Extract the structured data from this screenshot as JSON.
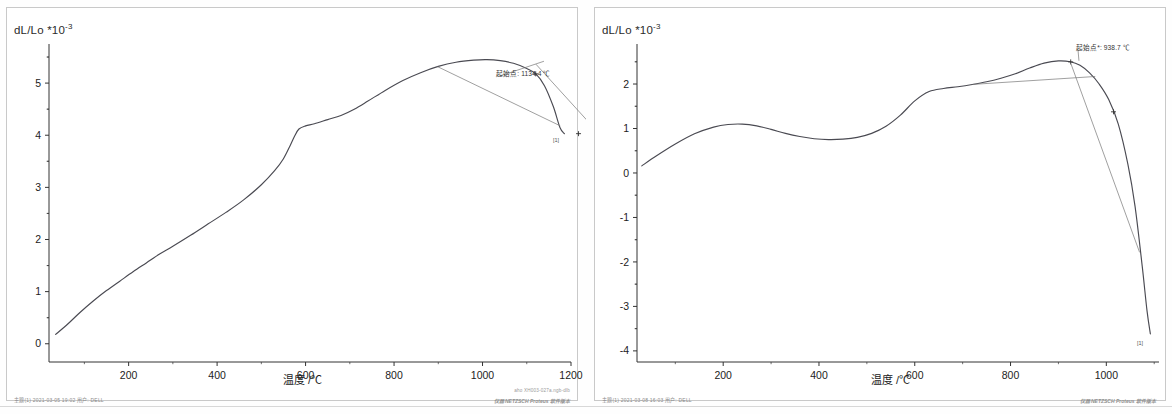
{
  "document": {
    "title": "Thermal dilatometry curves",
    "panel_count": 2
  },
  "charts": [
    {
      "id": "left",
      "ylabel": "dL/Lo *10",
      "ylabel_exp": "-3",
      "xlabel": "温度 /℃",
      "annotation": "起始点: 1134.4 ℃",
      "end_label": "[1]",
      "footer_left": "主题(1)  2021-03-05 19:02    用户: DELL",
      "footer_right": "aho XH003-027a.ngb-dlb",
      "footer_brand": "仪器 NETZSCH Proteus 软件版本",
      "xticks": [
        "200",
        "400",
        "600",
        "800",
        "1000",
        "1200"
      ],
      "yticks": [
        "0",
        "1",
        "2",
        "3",
        "4",
        "5"
      ]
    },
    {
      "id": "right",
      "ylabel": "dL/Lo *10",
      "ylabel_exp": "-3",
      "xlabel": "温度 /℃",
      "annotation": "起始点*: 938.7 ℃",
      "end_label": "[1]",
      "footer_left": "主题(1)  2021-03-08 16:03    用户: DELL",
      "footer_right": "",
      "footer_brand": "仪器 NETZSCH Proteus 软件版本",
      "xticks": [
        "200",
        "400",
        "600",
        "800",
        "1000"
      ],
      "yticks": [
        "-4",
        "-3",
        "-2",
        "-1",
        "0",
        "1",
        "2"
      ]
    }
  ],
  "chart_data": [
    {
      "type": "line",
      "id": "left",
      "title": "",
      "xlabel": "温度 /℃",
      "ylabel": "dL/Lo *10^-3",
      "xlim": [
        20,
        1200
      ],
      "ylim": [
        -0.35,
        5.75
      ],
      "xticks": [
        200,
        400,
        600,
        800,
        1000,
        1200
      ],
      "yticks": [
        0,
        1,
        2,
        3,
        4,
        5
      ],
      "grid": false,
      "legend": false,
      "annotations": [
        {
          "text": "起始点: 1134.4 ℃",
          "x": 1134.4,
          "y": 5.4
        }
      ],
      "series": [
        {
          "name": "dL/Lo",
          "x": [
            35,
            60,
            90,
            120,
            150,
            180,
            210,
            240,
            270,
            300,
            340,
            380,
            420,
            460,
            500,
            530,
            550,
            565,
            575,
            585,
            600,
            620,
            650,
            680,
            710,
            740,
            780,
            820,
            860,
            900,
            940,
            980,
            1010,
            1040,
            1070,
            1100,
            1120,
            1140,
            1160,
            1175,
            1185
          ],
          "y": [
            0.18,
            0.36,
            0.6,
            0.82,
            1.02,
            1.2,
            1.38,
            1.55,
            1.72,
            1.87,
            2.08,
            2.3,
            2.52,
            2.76,
            3.05,
            3.32,
            3.55,
            3.8,
            3.98,
            4.12,
            4.18,
            4.22,
            4.3,
            4.38,
            4.5,
            4.65,
            4.86,
            5.05,
            5.2,
            5.32,
            5.4,
            5.44,
            5.45,
            5.43,
            5.38,
            5.28,
            5.18,
            4.95,
            4.55,
            4.15,
            4.03
          ]
        }
      ]
    },
    {
      "type": "line",
      "id": "right",
      "title": "",
      "xlabel": "温度 /℃",
      "ylabel": "dL/Lo *10^-3",
      "xlim": [
        20,
        1110
      ],
      "ylim": [
        -4.25,
        2.9
      ],
      "xticks": [
        200,
        400,
        600,
        800,
        1000
      ],
      "yticks": [
        -4,
        -3,
        -2,
        -1,
        0,
        1,
        2
      ],
      "grid": false,
      "legend": false,
      "annotations": [
        {
          "text": "起始点*: 938.7 ℃",
          "x": 938.7,
          "y": 2.5
        }
      ],
      "series": [
        {
          "name": "dL/Lo",
          "x": [
            30,
            60,
            100,
            140,
            180,
            210,
            240,
            270,
            300,
            330,
            360,
            390,
            420,
            450,
            480,
            510,
            540,
            570,
            600,
            630,
            660,
            690,
            720,
            750,
            780,
            810,
            840,
            870,
            900,
            925,
            945,
            965,
            985,
            1005,
            1025,
            1045,
            1060,
            1075,
            1085,
            1092
          ],
          "y": [
            0.16,
            0.38,
            0.65,
            0.88,
            1.03,
            1.09,
            1.1,
            1.06,
            0.98,
            0.89,
            0.82,
            0.77,
            0.75,
            0.76,
            0.8,
            0.89,
            1.05,
            1.3,
            1.62,
            1.83,
            1.9,
            1.94,
            1.99,
            2.05,
            2.13,
            2.23,
            2.36,
            2.47,
            2.52,
            2.5,
            2.42,
            2.25,
            2.0,
            1.65,
            1.1,
            0.2,
            -0.75,
            -2.1,
            -3.1,
            -3.62
          ]
        }
      ]
    }
  ]
}
